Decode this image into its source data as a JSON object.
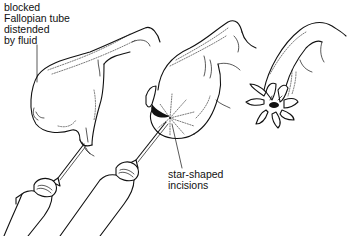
{
  "figure": {
    "type": "medical-line-illustration",
    "panels": [
      {
        "id": "panel-1",
        "description": "blocked tube distended by fluid, with syringe needle inserted"
      },
      {
        "id": "panel-2",
        "description": "tube with star-shaped incisions made at end, syringe needle inserted"
      },
      {
        "id": "panel-3",
        "description": "tube end opened with petals folded back"
      }
    ]
  },
  "labels": {
    "blocked": [
      "blocked",
      "Fallopian tube",
      "distended",
      "by fluid"
    ],
    "star": [
      "star-shaped",
      "incisions"
    ]
  },
  "colors": {
    "ink": "#111111",
    "background": "#ffffff"
  }
}
